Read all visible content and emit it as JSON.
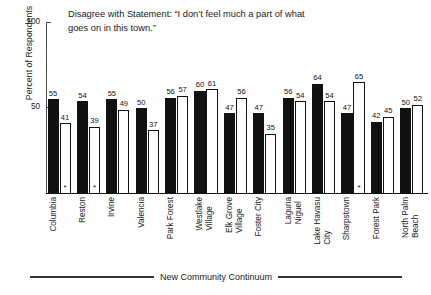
{
  "chart_data": {
    "type": "bar",
    "title": "Disagree with Statement: “I don’t feel much a part of what\ngoes on in this town.”",
    "xlabel": "New Community Continuum",
    "ylabel": "Percent of Respondents",
    "ylim": [
      0,
      100
    ],
    "yticks": [
      0,
      50,
      100
    ],
    "ytick_labels": [
      "",
      "50",
      "100"
    ],
    "grid": false,
    "legend": "none",
    "categories": [
      "Columbia",
      "Reston",
      "Irvine",
      "Valencia",
      "Park Forest",
      "Westlake\nVillage",
      "Elk Grove\nVillage",
      "Foster City",
      "Laguna\nNiguel",
      "Lake Havasu\nCity",
      "Sharpstown",
      "Forest Park",
      "North Palm\nBeach"
    ],
    "series": [
      {
        "name": "new community",
        "style": "filled",
        "values": [
          55,
          54,
          55,
          50,
          56,
          60,
          47,
          47,
          56,
          64,
          47,
          42,
          50
        ]
      },
      {
        "name": "paired conventional community",
        "style": "open",
        "values": [
          41,
          39,
          49,
          37,
          57,
          61,
          56,
          35,
          54,
          54,
          65,
          45,
          52
        ],
        "annotations": [
          "*",
          "*",
          "",
          "",
          "",
          "",
          "",
          "",
          "",
          "",
          "*",
          "",
          ""
        ]
      }
    ],
    "annotation_symbol": "*"
  }
}
